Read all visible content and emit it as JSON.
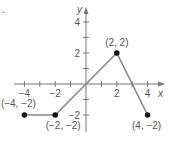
{
  "marker": ".",
  "chart_data": {
    "type": "line",
    "title": "",
    "xlabel": "x",
    "ylabel": "y",
    "xlim": [
      -4.5,
      4.8
    ],
    "ylim": [
      -3,
      5
    ],
    "x_ticks": [
      -4,
      -3,
      -2,
      -1,
      1,
      2,
      3,
      4
    ],
    "x_tick_labels": [
      "-4",
      "-2",
      "2",
      "4"
    ],
    "y_ticks": [
      -2,
      -1,
      1,
      2,
      3,
      4
    ],
    "y_tick_labels": [
      "-2",
      "2",
      "4"
    ],
    "grid": false,
    "series": [
      {
        "name": "piecewise",
        "x": [
          -4,
          -2,
          0,
          2,
          4
        ],
        "y": [
          -2,
          -2,
          0,
          2,
          -2
        ],
        "color": "#888888"
      }
    ],
    "points": [
      {
        "x": -4,
        "y": -2,
        "label": "(−4, −2)"
      },
      {
        "x": -2,
        "y": -2,
        "label": "(−2, −2)"
      },
      {
        "x": 2,
        "y": 2,
        "label": "(2, 2)"
      },
      {
        "x": 4,
        "y": -2,
        "label": "(4, −2)"
      }
    ]
  }
}
